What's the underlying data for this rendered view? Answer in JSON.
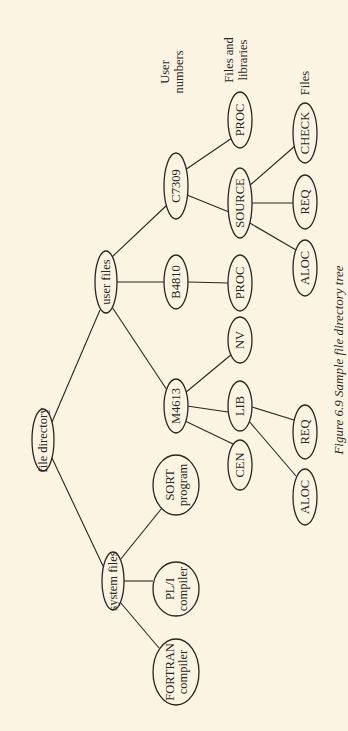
{
  "figure": {
    "caption": "Figure 6.9  Sample file directory tree",
    "orientation": "rotated-90-ccw",
    "colors": {
      "background": "#fbf4e2",
      "ink": "#2a2622"
    }
  },
  "level_labels": [
    {
      "id": "user-numbers",
      "lines": [
        "User",
        "numbers"
      ],
      "x": 172,
      "y": 72
    },
    {
      "id": "files-and-libraries",
      "lines": [
        "Files and",
        "libraries"
      ],
      "x": 236,
      "y": 60
    },
    {
      "id": "files",
      "lines": [
        "Files"
      ],
      "x": 305,
      "y": 83
    }
  ],
  "nodes": [
    {
      "id": "root",
      "lines": [
        "file directory"
      ],
      "x": 43,
      "y": 440,
      "rx": 11,
      "ry": 31
    },
    {
      "id": "system",
      "lines": [
        "system files"
      ],
      "x": 113,
      "y": 581,
      "rx": 11,
      "ry": 29
    },
    {
      "id": "user",
      "lines": [
        "user files"
      ],
      "x": 106,
      "y": 282,
      "rx": 11,
      "ry": 31
    },
    {
      "id": "fortran",
      "lines": [
        "FORTRAN",
        "compiler"
      ],
      "x": 176,
      "y": 672,
      "rx": 23,
      "ry": 33
    },
    {
      "id": "pli",
      "lines": [
        "PL/I",
        "compiler"
      ],
      "x": 176,
      "y": 589,
      "rx": 23,
      "ry": 27
    },
    {
      "id": "sort",
      "lines": [
        "SORT",
        "program"
      ],
      "x": 176,
      "y": 485,
      "rx": 23,
      "ry": 30
    },
    {
      "id": "m4613",
      "lines": [
        "M4613"
      ],
      "x": 176,
      "y": 406,
      "rx": 12,
      "ry": 27
    },
    {
      "id": "b4810",
      "lines": [
        "B4810"
      ],
      "x": 176,
      "y": 282,
      "rx": 12,
      "ry": 27
    },
    {
      "id": "c7309",
      "lines": [
        "C7309"
      ],
      "x": 176,
      "y": 186,
      "rx": 12,
      "ry": 33
    },
    {
      "id": "cen",
      "lines": [
        "CEN"
      ],
      "x": 240,
      "y": 465,
      "rx": 12,
      "ry": 25
    },
    {
      "id": "lib",
      "lines": [
        "LIB"
      ],
      "x": 240,
      "y": 406,
      "rx": 12,
      "ry": 25
    },
    {
      "id": "nv",
      "lines": [
        "NV"
      ],
      "x": 240,
      "y": 340,
      "rx": 12,
      "ry": 23
    },
    {
      "id": "proc-b",
      "lines": [
        "PROC"
      ],
      "x": 240,
      "y": 283,
      "rx": 12,
      "ry": 28
    },
    {
      "id": "source",
      "lines": [
        "SOURCE"
      ],
      "x": 240,
      "y": 203,
      "rx": 12,
      "ry": 35
    },
    {
      "id": "proc-c",
      "lines": [
        "PROC"
      ],
      "x": 240,
      "y": 120,
      "rx": 12,
      "ry": 28
    },
    {
      "id": "aloc-l",
      "lines": [
        "ALOC"
      ],
      "x": 305,
      "y": 497,
      "rx": 12,
      "ry": 28
    },
    {
      "id": "req-l",
      "lines": [
        "REQ"
      ],
      "x": 305,
      "y": 432,
      "rx": 12,
      "ry": 27
    },
    {
      "id": "aloc-s",
      "lines": [
        "ALOC"
      ],
      "x": 305,
      "y": 268,
      "rx": 12,
      "ry": 28
    },
    {
      "id": "req-s",
      "lines": [
        "REQ"
      ],
      "x": 305,
      "y": 202,
      "rx": 12,
      "ry": 27
    },
    {
      "id": "check",
      "lines": [
        "CHECK"
      ],
      "x": 305,
      "y": 133,
      "rx": 12,
      "ry": 30
    }
  ],
  "edges": [
    {
      "from": "root",
      "to": "system",
      "x1": 52,
      "y1": 458,
      "x2": 103,
      "y2": 566
    },
    {
      "from": "root",
      "to": "user",
      "x1": 52,
      "y1": 422,
      "x2": 100,
      "y2": 310
    },
    {
      "from": "system",
      "to": "fortran",
      "x1": 120,
      "y1": 602,
      "x2": 159,
      "y2": 648
    },
    {
      "from": "system",
      "to": "pli",
      "x1": 124,
      "y1": 581,
      "x2": 153,
      "y2": 581
    },
    {
      "from": "system",
      "to": "sort",
      "x1": 120,
      "y1": 560,
      "x2": 162,
      "y2": 508
    },
    {
      "from": "user",
      "to": "m4613",
      "x1": 112,
      "y1": 307,
      "x2": 167,
      "y2": 390
    },
    {
      "from": "user",
      "to": "b4810",
      "x1": 117,
      "y1": 282,
      "x2": 164,
      "y2": 282
    },
    {
      "from": "user",
      "to": "c7309",
      "x1": 112,
      "y1": 257,
      "x2": 167,
      "y2": 205
    },
    {
      "from": "m4613",
      "to": "cen",
      "x1": 183,
      "y1": 420,
      "x2": 233,
      "y2": 444
    },
    {
      "from": "m4613",
      "to": "lib",
      "x1": 187,
      "y1": 406,
      "x2": 228,
      "y2": 412
    },
    {
      "from": "m4613",
      "to": "nv",
      "x1": 185,
      "y1": 393,
      "x2": 232,
      "y2": 354
    },
    {
      "from": "b4810",
      "to": "proc-b",
      "x1": 188,
      "y1": 282,
      "x2": 228,
      "y2": 283
    },
    {
      "from": "c7309",
      "to": "source",
      "x1": 187,
      "y1": 195,
      "x2": 229,
      "y2": 212
    },
    {
      "from": "c7309",
      "to": "proc-c",
      "x1": 185,
      "y1": 170,
      "x2": 232,
      "y2": 138
    },
    {
      "from": "lib",
      "to": "aloc-l",
      "x1": 248,
      "y1": 420,
      "x2": 296,
      "y2": 476
    },
    {
      "from": "lib",
      "to": "req-l",
      "x1": 252,
      "y1": 407,
      "x2": 294,
      "y2": 420
    },
    {
      "from": "source",
      "to": "aloc-s",
      "x1": 248,
      "y1": 222,
      "x2": 296,
      "y2": 250
    },
    {
      "from": "source",
      "to": "req-s",
      "x1": 252,
      "y1": 203,
      "x2": 293,
      "y2": 203
    },
    {
      "from": "source",
      "to": "check",
      "x1": 249,
      "y1": 186,
      "x2": 295,
      "y2": 146
    }
  ],
  "caption_pos": {
    "x": 338,
    "y": 360
  }
}
